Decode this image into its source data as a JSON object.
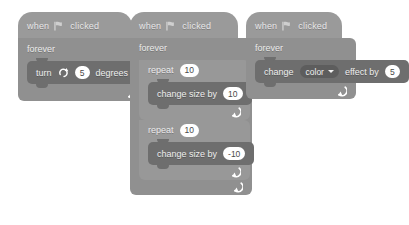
{
  "colors": {
    "hat_block": "#9a9a9a",
    "c_block": "#909090",
    "command_block": "#6e6e6e",
    "dropdown": "#5d5d5d",
    "input_oval": "#ffffff",
    "block_text": "#efefef",
    "canvas": "#ffffff"
  },
  "scripts": [
    {
      "id": "turn-script",
      "hat": {
        "when": "when",
        "flag_icon": "green-flag-icon",
        "clicked": "clicked"
      },
      "forever": {
        "label": "forever",
        "loop_icon": "loop-arrow-icon"
      },
      "turn": {
        "label_before": "turn",
        "icon": "turn-clockwise-icon",
        "degrees": "5",
        "label_after": "degrees"
      }
    },
    {
      "id": "size-script",
      "hat": {
        "when": "when",
        "flag_icon": "green-flag-icon",
        "clicked": "clicked"
      },
      "forever": {
        "label": "forever",
        "loop_icon": "loop-arrow-icon"
      },
      "repeat_1": {
        "label": "repeat",
        "times": "10",
        "loop_icon": "loop-arrow-icon"
      },
      "change_size_1": {
        "label": "change size by",
        "value": "10"
      },
      "repeat_2": {
        "label": "repeat",
        "times": "10",
        "loop_icon": "loop-arrow-icon"
      },
      "change_size_2": {
        "label": "change size by",
        "value": "-10"
      }
    },
    {
      "id": "color-script",
      "hat": {
        "when": "when",
        "flag_icon": "green-flag-icon",
        "clicked": "clicked"
      },
      "forever": {
        "label": "forever",
        "loop_icon": "loop-arrow-icon"
      },
      "change_effect": {
        "label_before": "change",
        "effect": "color",
        "caret_icon": "chevron-down-icon",
        "label_middle": "effect by",
        "value": "5"
      }
    }
  ]
}
